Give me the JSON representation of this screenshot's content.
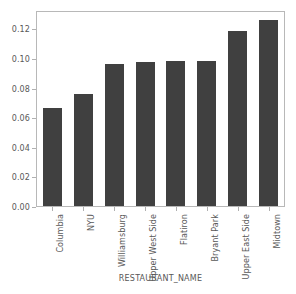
{
  "chart_data": {
    "type": "bar",
    "title": "",
    "xlabel": "RESTAURANT_NAME",
    "ylabel": "",
    "categories": [
      "Columbia",
      "NYU",
      "Williamsburg",
      "Upper West Side",
      "Flatiron",
      "Bryant Park",
      "Upper East Side",
      "Midtown"
    ],
    "values": [
      0.0665,
      0.0757,
      0.0963,
      0.0972,
      0.0978,
      0.0983,
      0.1182,
      0.1258
    ],
    "ylim": [
      0.0,
      0.1325
    ],
    "yticks": [
      0.0,
      0.02,
      0.04,
      0.06,
      0.08,
      0.1,
      0.12
    ],
    "ytick_labels": [
      "0.00",
      "0.02",
      "0.04",
      "0.06",
      "0.08",
      "0.10",
      "0.12"
    ],
    "grid": false,
    "legend": null,
    "bar_color": "#404040",
    "frame_color": "#b8b8b8",
    "tick_label_color": "#585858",
    "background_color": "#ffffff",
    "orientation": "vertical",
    "xtick_label_rotation": 90
  }
}
